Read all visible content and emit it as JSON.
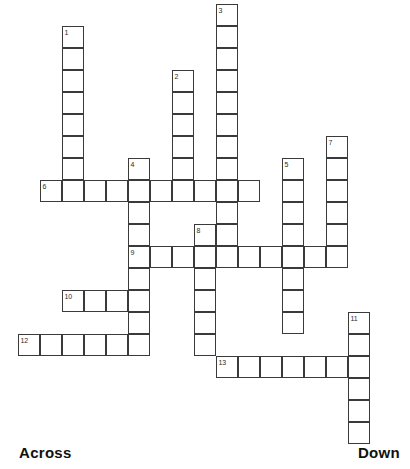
{
  "puzzle": {
    "kind": "crossword-grid",
    "cell_size": 22,
    "grid_origin": {
      "x": 18,
      "y": 26
    },
    "line_color": "#3a3a3a",
    "cell_fill": "#ffffff",
    "background": "#ffffff",
    "numbers": [
      {
        "label": "1",
        "col": 2,
        "row": 0
      },
      {
        "label": "2",
        "col": 7,
        "row": 2
      },
      {
        "label": "3",
        "col": 9,
        "row": -1
      },
      {
        "label": "4",
        "col": 5,
        "row": 6
      },
      {
        "label": "5",
        "col": 12,
        "row": 6
      },
      {
        "label": "6",
        "col": 1,
        "row": 7
      },
      {
        "label": "7",
        "col": 14,
        "row": 5
      },
      {
        "label": "8",
        "col": 8,
        "row": 9
      },
      {
        "label": "9",
        "col": 5,
        "row": 10
      },
      {
        "label": "10",
        "col": 2,
        "row": 12
      },
      {
        "label": "11",
        "col": 15,
        "row": 13
      },
      {
        "label": "12",
        "col": 0,
        "row": 14
      },
      {
        "label": "13",
        "col": 9,
        "row": 15
      }
    ],
    "entries": [
      {
        "number": "1",
        "direction": "down",
        "col": 2,
        "row": 0,
        "length": 8
      },
      {
        "number": "2",
        "direction": "down",
        "col": 7,
        "row": 2,
        "length": 6
      },
      {
        "number": "3",
        "direction": "down",
        "col": 9,
        "row": -1,
        "length": 12
      },
      {
        "number": "4",
        "direction": "down",
        "col": 5,
        "row": 6,
        "length": 9
      },
      {
        "number": "5",
        "direction": "down",
        "col": 12,
        "row": 6,
        "length": 8
      },
      {
        "number": "6",
        "direction": "across",
        "col": 1,
        "row": 7,
        "length": 10
      },
      {
        "number": "7",
        "direction": "down",
        "col": 14,
        "row": 5,
        "length": 6
      },
      {
        "number": "8",
        "direction": "down",
        "col": 8,
        "row": 9,
        "length": 6
      },
      {
        "number": "9",
        "direction": "across",
        "col": 5,
        "row": 10,
        "length": 10
      },
      {
        "number": "10",
        "direction": "across",
        "col": 2,
        "row": 12,
        "length": 4
      },
      {
        "number": "11",
        "direction": "down",
        "col": 15,
        "row": 13,
        "length": 6
      },
      {
        "number": "12",
        "direction": "across",
        "col": 0,
        "row": 14,
        "length": 6
      },
      {
        "number": "13",
        "direction": "across",
        "col": 9,
        "row": 15,
        "length": 6
      }
    ]
  },
  "legend": {
    "across_label": "Across",
    "down_label": "Down"
  }
}
